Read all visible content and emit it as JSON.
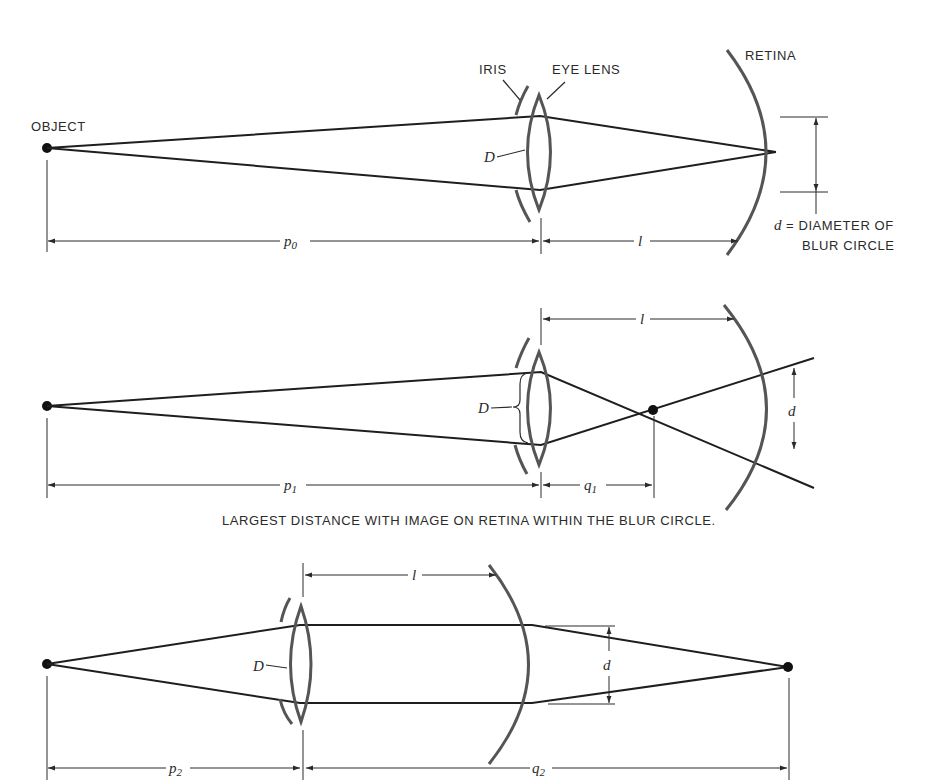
{
  "figure": {
    "panels": [
      {
        "id": "panel-focused",
        "labels": {
          "object": "OBJECT",
          "iris": "IRIS",
          "eye_lens": "EYE LENS",
          "retina": "RETINA",
          "aperture": "D",
          "object_distance": "p",
          "object_distance_sub": "0",
          "lens_retina_distance": "l",
          "blur_symbol": "d",
          "blur_def_line1": "= DIAMETER OF",
          "blur_def_line2": "BLUR CIRCLE"
        }
      },
      {
        "id": "panel-far-limit",
        "labels": {
          "aperture": "D",
          "object_distance": "p",
          "object_distance_sub": "1",
          "image_distance": "q",
          "image_distance_sub": "1",
          "lens_retina_distance": "l",
          "blur_symbol": "d"
        },
        "caption": "LARGEST DISTANCE WITH IMAGE ON RETINA WITHIN THE BLUR CIRCLE."
      },
      {
        "id": "panel-near-limit",
        "labels": {
          "aperture": "D",
          "object_distance": "p",
          "object_distance_sub": "2",
          "image_distance": "q",
          "image_distance_sub": "2",
          "lens_retina_distance": "l",
          "blur_symbol": "d"
        }
      }
    ],
    "colors": {
      "ray": "#1e1e1e",
      "optic": "#555555",
      "text": "#2a2a2a",
      "background": "#ffffff"
    }
  }
}
